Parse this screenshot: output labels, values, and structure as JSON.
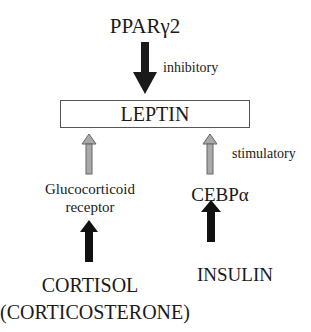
{
  "nodes": {
    "top": "PPARγ2",
    "center": "LEPTIN",
    "left_mid_line1": "Glucocorticoid",
    "left_mid_line2": "receptor",
    "right_mid": "CEBPα",
    "left_bottom_line1": "CORTISOL",
    "left_bottom_line2": "(CORTICOSTERONE)",
    "right_bottom": "INSULIN"
  },
  "labels": {
    "inhibitory": "inhibitory",
    "stimulatory": "stimulatory"
  },
  "colors": {
    "dark_arrow": "#1a1a1a",
    "gray_arrow": "#a9a9a9",
    "gray_arrow_outline": "#666666",
    "box_border": "#555555"
  }
}
